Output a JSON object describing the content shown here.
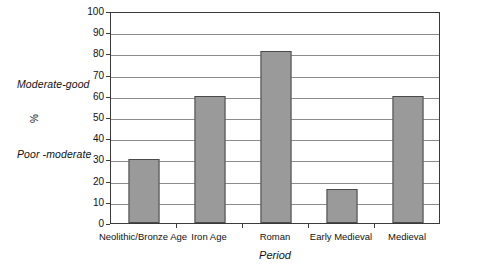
{
  "chart_data": {
    "type": "bar",
    "title": "",
    "subtitle": "",
    "xlabel": "Period",
    "ylabel": "%",
    "categories": [
      "Neolithic/Bronze Age",
      "Iron Age",
      "Roman",
      "Early Medieval",
      "Medieval"
    ],
    "values": [
      30,
      60,
      81,
      16,
      60
    ],
    "ylim": [
      0,
      100
    ],
    "ytick_step": 10,
    "yticks": [
      0,
      10,
      20,
      30,
      40,
      50,
      60,
      70,
      80,
      90,
      100
    ],
    "ytick_labels": [
      "0",
      "10",
      "20",
      "30",
      "40",
      "50",
      "60",
      "70",
      "80",
      "90",
      "100"
    ],
    "grid": "horizontal",
    "legend": "none",
    "annotations": [
      {
        "text": "Moderate-good",
        "value": 65,
        "style": "italic"
      },
      {
        "text": "%",
        "value": 50,
        "style": "rotated"
      },
      {
        "text": "Poor -moderate",
        "value": 30,
        "style": "italic"
      }
    ],
    "series": [
      {
        "name": "Condition rating",
        "values": [
          30,
          60,
          81,
          16,
          60
        ]
      }
    ],
    "colors": {
      "bar_fill": "#9a9a9a",
      "bar_outline": "#4a4a4a",
      "gridline": "#8c8c8c",
      "axis": "#3a3a3a",
      "background": "#ffffff",
      "text": "#111111"
    }
  },
  "side_labels": {
    "upper": "Moderate-good",
    "unit": "%",
    "lower": "Poor -moderate"
  }
}
